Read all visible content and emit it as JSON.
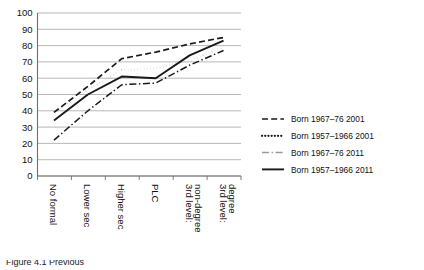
{
  "chart_data": {
    "type": "line",
    "title": "",
    "xlabel": "",
    "ylabel": "",
    "ylim": [
      0,
      100
    ],
    "ytick_step": 10,
    "grid": true,
    "legend_position": "right",
    "categories": [
      "No formal",
      "Lower sec",
      "Higher sec",
      "PLC",
      "3rd level: non-degree",
      "3rd level: degree"
    ],
    "ytick_labels": [
      "0",
      "10",
      "20",
      "30",
      "40",
      "50",
      "60",
      "70",
      "80",
      "90",
      "100"
    ],
    "series": [
      {
        "name": "Born 1967–76 2001",
        "style": "dashed",
        "color": "#1a1a1a",
        "values": [
          39,
          55,
          72,
          76,
          81,
          85
        ]
      },
      {
        "name": "Born 1957–1966 2001",
        "style": "dotted",
        "color": "#1a1a1a",
        "values": [
          39,
          53,
          65,
          66,
          71,
          79
        ]
      },
      {
        "name": "Born 1967–76 2011",
        "style": "dash-dot",
        "color": "#9a9a9a",
        "values": [
          22,
          40,
          56,
          57,
          68,
          77
        ]
      },
      {
        "name": "Born 1957–1966 2011",
        "style": "solid",
        "color": "#1a1a1a",
        "values": [
          34,
          50,
          61,
          60,
          74,
          83
        ]
      }
    ]
  },
  "caption": {
    "text": "Figure 4.1 Previous"
  }
}
